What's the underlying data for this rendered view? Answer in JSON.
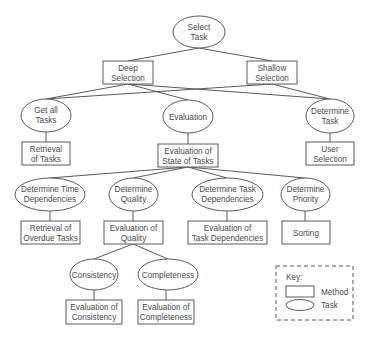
{
  "diagram": {
    "type": "task-method hierarchy",
    "nodes": {
      "select_task": {
        "kind": "task",
        "lines": [
          "Select",
          "Task"
        ]
      },
      "deep_selection": {
        "kind": "method",
        "lines": [
          "Deep",
          "Selection"
        ]
      },
      "shallow_selection": {
        "kind": "method",
        "lines": [
          "Shallow",
          "Selection"
        ]
      },
      "get_all_tasks": {
        "kind": "task",
        "lines": [
          "Get all",
          "Tasks"
        ]
      },
      "evaluation": {
        "kind": "task",
        "lines": [
          "Evaluation"
        ]
      },
      "determine_task": {
        "kind": "task",
        "lines": [
          "Determine",
          "Task"
        ]
      },
      "retrieval_of_tasks": {
        "kind": "method",
        "lines": [
          "Retrieval",
          "of Tasks"
        ]
      },
      "evaluation_of_state": {
        "kind": "method",
        "lines": [
          "Evaluation of",
          "State of Tasks"
        ]
      },
      "user_selection": {
        "kind": "method",
        "lines": [
          "User",
          "Selection"
        ]
      },
      "determine_time_dependencies": {
        "kind": "task",
        "lines": [
          "Determine Time",
          "Dependencies"
        ]
      },
      "determine_quality": {
        "kind": "task",
        "lines": [
          "Determine",
          "Quality"
        ]
      },
      "determine_task_dependencies": {
        "kind": "task",
        "lines": [
          "Determine Task",
          "Dependencies"
        ]
      },
      "determine_priority": {
        "kind": "task",
        "lines": [
          "Determine",
          "Priority"
        ]
      },
      "retrieval_of_overdue_tasks": {
        "kind": "method",
        "lines": [
          "Retrieval of",
          "Overdue Tasks"
        ]
      },
      "evaluation_of_quality": {
        "kind": "method",
        "lines": [
          "Evaluation of",
          "Quality"
        ]
      },
      "evaluation_of_task_dependencies": {
        "kind": "method",
        "lines": [
          "Evaluation of",
          "Task Dependencies"
        ]
      },
      "sorting": {
        "kind": "method",
        "lines": [
          "Sorting"
        ]
      },
      "consistency": {
        "kind": "task",
        "lines": [
          "Consistency"
        ]
      },
      "completeness": {
        "kind": "task",
        "lines": [
          "Completeness"
        ]
      },
      "evaluation_of_consistency": {
        "kind": "method",
        "lines": [
          "Evaluation of",
          "Consistency"
        ]
      },
      "evaluation_of_completeness": {
        "kind": "method",
        "lines": [
          "Evaluation of",
          "Completeness"
        ]
      }
    },
    "edges": [
      [
        "select_task",
        "deep_selection"
      ],
      [
        "select_task",
        "shallow_selection"
      ],
      [
        "deep_selection",
        "get_all_tasks"
      ],
      [
        "deep_selection",
        "evaluation"
      ],
      [
        "deep_selection",
        "determine_task"
      ],
      [
        "shallow_selection",
        "get_all_tasks"
      ],
      [
        "shallow_selection",
        "determine_task"
      ],
      [
        "get_all_tasks",
        "retrieval_of_tasks"
      ],
      [
        "evaluation",
        "evaluation_of_state"
      ],
      [
        "determine_task",
        "user_selection"
      ],
      [
        "evaluation_of_state",
        "determine_time_dependencies"
      ],
      [
        "evaluation_of_state",
        "determine_quality"
      ],
      [
        "evaluation_of_state",
        "determine_task_dependencies"
      ],
      [
        "evaluation_of_state",
        "determine_priority"
      ],
      [
        "determine_time_dependencies",
        "retrieval_of_overdue_tasks"
      ],
      [
        "determine_quality",
        "evaluation_of_quality"
      ],
      [
        "determine_task_dependencies",
        "evaluation_of_task_dependencies"
      ],
      [
        "determine_priority",
        "sorting"
      ],
      [
        "evaluation_of_quality",
        "consistency"
      ],
      [
        "evaluation_of_quality",
        "completeness"
      ],
      [
        "consistency",
        "evaluation_of_consistency"
      ],
      [
        "completeness",
        "evaluation_of_completeness"
      ]
    ]
  },
  "key": {
    "title": "Key:",
    "method_label": "Method",
    "task_label": "Task"
  },
  "colors": {
    "stroke": "#5a5a5a",
    "text": "#4a4a4a",
    "background": "#ffffff"
  }
}
